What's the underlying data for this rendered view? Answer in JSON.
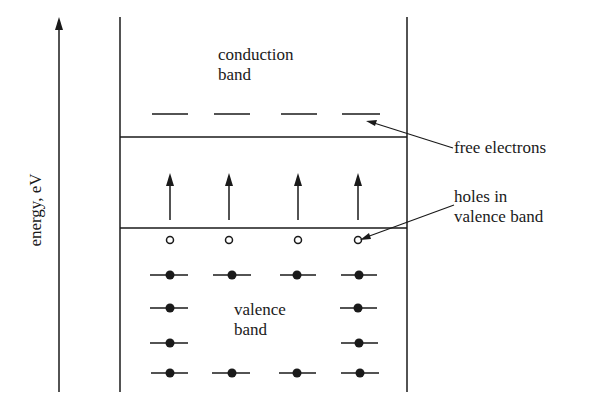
{
  "diagram": {
    "axis": {
      "label": "energy, eV",
      "direction": "up"
    },
    "bands": {
      "conduction": {
        "line1": "conduction",
        "line2": "band"
      },
      "valence": {
        "line1": "valence",
        "line2": "band"
      }
    },
    "annotations": {
      "free_electrons": "free electrons",
      "holes_line1": "holes in",
      "holes_line2": "valence band"
    },
    "columns_x": [
      170,
      229,
      298,
      358
    ],
    "free_electron_count": 4,
    "excitation_arrow_count": 4,
    "hole_count": 4,
    "valence_electron_rows": [
      {
        "y": 275,
        "columns": [
          1,
          2,
          3,
          4
        ]
      },
      {
        "y": 306,
        "columns": [
          1,
          4
        ]
      },
      {
        "y": 343,
        "columns": [
          1,
          4
        ]
      },
      {
        "y": 373,
        "columns": [
          1,
          2,
          3,
          4
        ]
      }
    ],
    "colors": {
      "ink": "#1a1a1a",
      "background": "#ffffff"
    }
  }
}
